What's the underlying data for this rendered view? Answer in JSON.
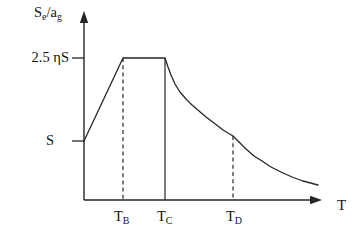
{
  "figure": {
    "background": "#ffffff",
    "line_color": "#262626",
    "text_color": "#141414"
  },
  "labels": {
    "y_axis": {
      "base1": "S",
      "sub1": "e",
      "base2": "/a",
      "sub2": "g"
    },
    "y_tick_upper": "2.5 ηS",
    "y_tick_lower": "S",
    "x_tick_b": {
      "base": "T",
      "sub": "B"
    },
    "x_tick_c": {
      "base": "T",
      "sub": "C"
    },
    "x_tick_d": {
      "base": "T",
      "sub": "D"
    },
    "x_axis": "T"
  },
  "chart_data": {
    "type": "line",
    "title": "",
    "xlabel": "T",
    "ylabel": "Se/ag",
    "x_tick_labels": [
      "TB",
      "TC",
      "TD"
    ],
    "y_tick_labels": [
      "2.5 ηS",
      "S"
    ],
    "grid": false,
    "legend": false,
    "shape_description": "spectrum rises linearly from level S at T=0 to plateau 2.5 ηS between TB and TC, decays as a curve to a kink at TD, then decays flatter toward the T axis",
    "axes_px": {
      "origin": [
        84,
        200
      ],
      "y_arrow_tip": [
        84,
        11
      ],
      "x_arrow_tip": [
        322,
        200
      ]
    },
    "y_ticks_px": [
      {
        "y": 58,
        "label": "2.5 ηS"
      },
      {
        "y": 141,
        "label": "S"
      }
    ],
    "x_breaks_px": [
      {
        "x": 123,
        "label": "TB",
        "style": "dashed",
        "y_top": 58
      },
      {
        "x": 165,
        "label": "TC",
        "style": "solid",
        "y_top": 58
      },
      {
        "x": 233,
        "label": "TD",
        "style": "dashed",
        "y_top": 136
      }
    ],
    "curve_px": [
      [
        84,
        141
      ],
      [
        123,
        58
      ],
      [
        165,
        58
      ],
      [
        168,
        67
      ],
      [
        171,
        75
      ],
      [
        175,
        84
      ],
      [
        180,
        92
      ],
      [
        186,
        99
      ],
      [
        192,
        105
      ],
      [
        199,
        111
      ],
      [
        206,
        117
      ],
      [
        214,
        123
      ],
      [
        223,
        130
      ],
      [
        233,
        136
      ],
      [
        239,
        142
      ],
      [
        246,
        149
      ],
      [
        254,
        156
      ],
      [
        262,
        161
      ],
      [
        271,
        167
      ],
      [
        281,
        172
      ],
      [
        292,
        177
      ],
      [
        303,
        181
      ],
      [
        318,
        185
      ]
    ]
  }
}
